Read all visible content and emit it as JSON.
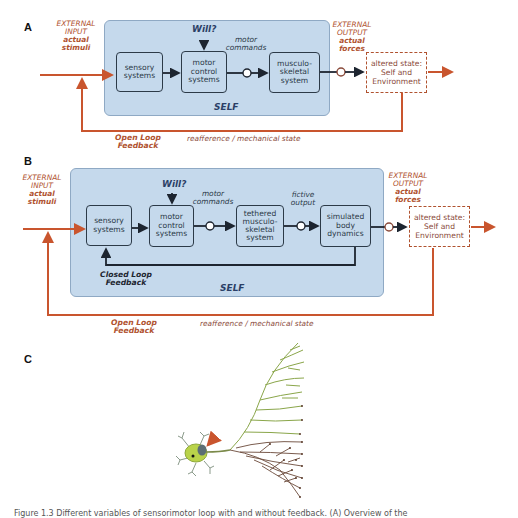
{
  "panel_a": {
    "letter": "A",
    "external_input": {
      "line1": "EXTERNAL",
      "line2": "INPUT",
      "bold1": "actual",
      "bold2": "stimuli"
    },
    "will": "Will?",
    "motor_commands": {
      "line1": "motor",
      "line2": "commands"
    },
    "blocks": {
      "sensory": {
        "line1": "sensory",
        "line2": "systems"
      },
      "motor_control": {
        "line1": "motor",
        "line2": "control",
        "line3": "systems"
      },
      "musculoskeletal": {
        "line1": "musculo-",
        "line2": "skeletal",
        "line3": "system"
      }
    },
    "self_label": "SELF",
    "external_output": {
      "line1": "EXTERNAL",
      "line2": "OUTPUT",
      "bold1": "actual",
      "bold2": "forces"
    },
    "altered_state": {
      "line1": "altered state:",
      "line2": "Self and",
      "line3": "Environment"
    },
    "open_loop": {
      "line1": "Open Loop",
      "line2": "Feedback"
    },
    "reafference": "reafference / mechanical state"
  },
  "panel_b": {
    "letter": "B",
    "external_input": {
      "line1": "EXTERNAL",
      "line2": "INPUT",
      "bold1": "actual",
      "bold2": "stimuli"
    },
    "will": "Will?",
    "motor_commands": {
      "line1": "motor",
      "line2": "commands"
    },
    "fictive_output": {
      "line1": "fictive",
      "line2": "output"
    },
    "blocks": {
      "sensory": {
        "line1": "sensory",
        "line2": "systems"
      },
      "motor_control": {
        "line1": "motor",
        "line2": "control",
        "line3": "systems"
      },
      "tethered": {
        "line1": "tethered",
        "line2": "musculo-",
        "line3": "skeletal",
        "line4": "system"
      },
      "simulated": {
        "line1": "simulated",
        "line2": "body",
        "line3": "dynamics"
      }
    },
    "closed_loop": {
      "line1": "Closed Loop",
      "line2": "Feedback"
    },
    "self_label": "SELF",
    "external_output": {
      "line1": "EXTERNAL",
      "line2": "OUTPUT",
      "bold1": "actual",
      "bold2": "forces"
    },
    "altered_state": {
      "line1": "altered state:",
      "line2": "Self and",
      "line3": "Environment"
    },
    "open_loop": {
      "line1": "Open Loop",
      "line2": "Feedback"
    },
    "reafference": "reafference / mechanical state"
  },
  "panel_c": {
    "letter": "C",
    "illustration": "neuron-with-branching-axon"
  },
  "caption": "Figure 1.3 Different variables of sensorimotor loop with and without feedback. (A) Overview of the",
  "colors": {
    "self_fill": "#c5d9ec",
    "block_border": "#2c3a48",
    "feedback_red": "#c9552e",
    "label_red": "#b0522f",
    "will_blue": "#2b3f66"
  }
}
